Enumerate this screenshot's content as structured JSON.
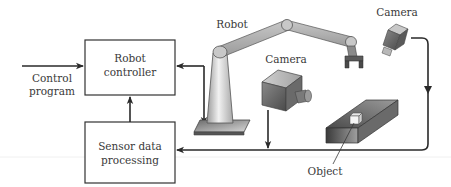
{
  "diagram": {
    "blocks": {
      "robot_controller": {
        "line1": "Robot",
        "line2": "controller"
      },
      "sensor_processing": {
        "line1": "Sensor data",
        "line2": "processing"
      }
    },
    "inputs": {
      "control_program": {
        "line1": "Control",
        "line2": "program"
      }
    },
    "components": {
      "robot": {
        "label": "Robot"
      },
      "camera_fixed": {
        "label": "Camera"
      },
      "camera_overhead": {
        "label": "Camera"
      },
      "object": {
        "label": "Object"
      }
    },
    "connections": [
      {
        "from": "Control program",
        "to": "Robot controller"
      },
      {
        "from": "Sensor data processing",
        "to": "Robot controller"
      },
      {
        "from": "Robot controller",
        "to": "Robot"
      },
      {
        "from": "Robot",
        "to": "Robot controller"
      },
      {
        "from": "Camera (fixed)",
        "to": "Sensor data processing"
      },
      {
        "from": "Camera (overhead)",
        "to": "Sensor data processing"
      }
    ],
    "colors": {
      "line": "#2a2a2a",
      "box_border": "#333333",
      "text": "#3a3a3a",
      "metal_light": "#e6e6e6",
      "metal_dark": "#5a5a5a"
    }
  }
}
